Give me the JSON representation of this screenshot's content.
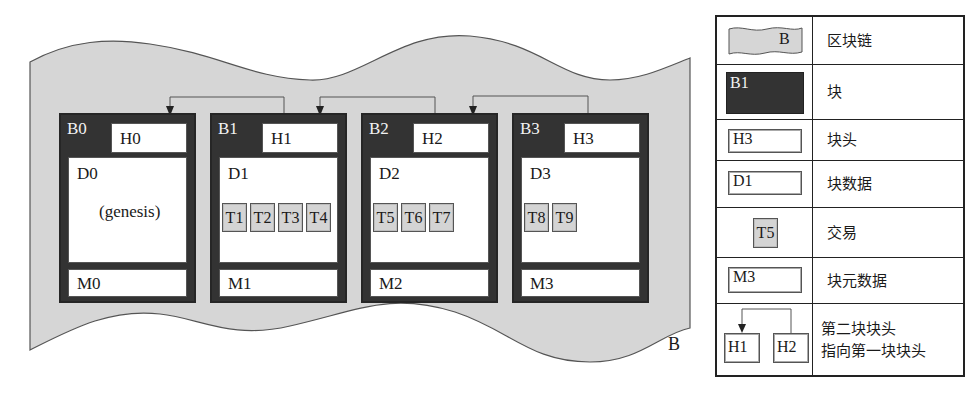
{
  "diagram": {
    "chain_label": "B",
    "blocks": [
      {
        "id": "B0",
        "header": "H0",
        "data": "D0",
        "note": "(genesis)",
        "transactions": [],
        "metadata": "M0"
      },
      {
        "id": "B1",
        "header": "H1",
        "data": "D1",
        "note": "",
        "transactions": [
          "T1",
          "T2",
          "T3",
          "T4"
        ],
        "metadata": "M1"
      },
      {
        "id": "B2",
        "header": "H2",
        "data": "D2",
        "note": "",
        "transactions": [
          "T5",
          "T6",
          "T7"
        ],
        "metadata": "M2"
      },
      {
        "id": "B3",
        "header": "H3",
        "data": "D3",
        "note": "",
        "transactions": [
          "T8",
          "T9"
        ],
        "metadata": "M3"
      }
    ],
    "links": [
      {
        "from": "H1",
        "to": "H0"
      },
      {
        "from": "H2",
        "to": "H1"
      },
      {
        "from": "H3",
        "to": "H2"
      }
    ],
    "colors": {
      "chain_fill": "#d6d6d6",
      "block_fill": "#333333",
      "transaction_fill": "#d4d4d4",
      "section_fill": "#ffffff"
    }
  },
  "legend": {
    "rows": [
      {
        "icon": "blockchain-wave",
        "icon_label": "B",
        "text": "区块链"
      },
      {
        "icon": "block-dark",
        "icon_label": "B1",
        "text": "块"
      },
      {
        "icon": "header-box",
        "icon_label": "H3",
        "text": "块头"
      },
      {
        "icon": "data-box",
        "icon_label": "D1",
        "text": "块数据"
      },
      {
        "icon": "transaction-box",
        "icon_label": "T5",
        "text": "交易"
      },
      {
        "icon": "metadata-box",
        "icon_label": "M3",
        "text": "块元数据"
      },
      {
        "icon": "header-link",
        "icon_label_a": "H1",
        "icon_label_b": "H2",
        "text_line1": "第二块块头",
        "text_line2": "指向第一块块头"
      }
    ]
  }
}
